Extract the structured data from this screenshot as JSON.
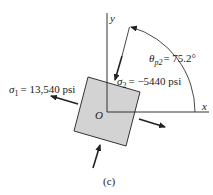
{
  "figure": {
    "caption": "(c)",
    "axes": {
      "x_label": "x",
      "y_label": "y",
      "origin_label": "O"
    },
    "angle": {
      "symbol": "θ",
      "subscript": "p2",
      "value_text": "= 75.2°",
      "degrees": 75.2
    },
    "sigma1": {
      "symbol": "σ",
      "subscript": "1",
      "value_text": "= 13,540 psi"
    },
    "sigma2": {
      "symbol": "σ",
      "subscript": "2",
      "value_text": "= −5440 psi"
    },
    "colors": {
      "element_fill": "#d3d3d3",
      "line": "#222222"
    }
  }
}
